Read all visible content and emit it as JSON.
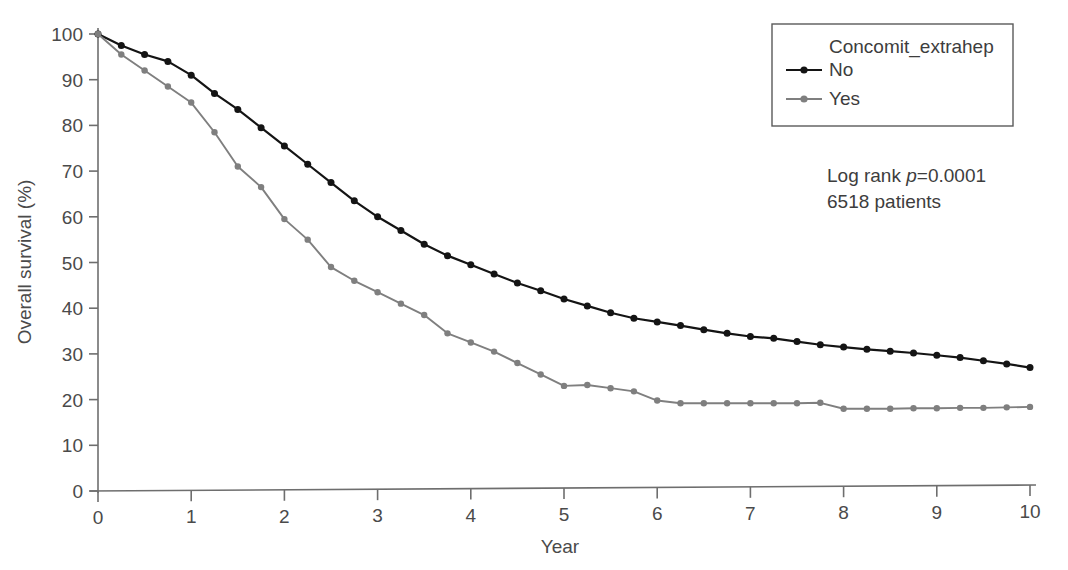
{
  "chart_data": {
    "type": "line",
    "title": "",
    "xlabel": "Year",
    "ylabel": "Overall survival (%)",
    "xlim": [
      0,
      10
    ],
    "ylim": [
      0,
      100
    ],
    "xticks": [
      0,
      1,
      2,
      3,
      4,
      5,
      6,
      7,
      8,
      9,
      10
    ],
    "yticks": [
      0,
      10,
      20,
      30,
      40,
      50,
      60,
      70,
      80,
      90,
      100
    ],
    "grid": false,
    "legend_position": "top-right",
    "legend_title": "Concomit_extrahep",
    "markers": true,
    "marker_interval": 0.25,
    "series": [
      {
        "name": "No",
        "color": "#141414",
        "x": [
          0,
          0.25,
          0.5,
          0.75,
          1,
          1.25,
          1.5,
          1.75,
          2,
          2.25,
          2.5,
          2.75,
          3,
          3.25,
          3.5,
          3.75,
          4,
          4.25,
          4.5,
          4.75,
          5,
          5.25,
          5.5,
          5.75,
          6,
          6.25,
          6.5,
          6.75,
          7,
          7.25,
          7.5,
          7.75,
          8,
          8.25,
          8.5,
          8.75,
          9,
          9.25,
          9.5,
          9.75,
          10
        ],
        "values": [
          100,
          97.5,
          95.5,
          94,
          91,
          87,
          83.5,
          79.5,
          75.5,
          71.5,
          67.5,
          63.5,
          60,
          57,
          54,
          51.5,
          49.5,
          47.5,
          45.5,
          43.8,
          42,
          40.5,
          39,
          37.8,
          37,
          36.2,
          35.3,
          34.5,
          33.8,
          33.4,
          32.7,
          32,
          31.5,
          31,
          30.6,
          30.2,
          29.7,
          29.2,
          28.5,
          27.8,
          27
        ]
      },
      {
        "name": "Yes",
        "color": "#7f7f7f",
        "x": [
          0,
          0.25,
          0.5,
          0.75,
          1,
          1.25,
          1.5,
          1.75,
          2,
          2.25,
          2.5,
          2.75,
          3,
          3.25,
          3.5,
          3.75,
          4,
          4.25,
          4.5,
          4.75,
          5,
          5.25,
          5.5,
          5.75,
          6,
          6.25,
          6.5,
          6.75,
          7,
          7.25,
          7.5,
          7.75,
          8,
          8.25,
          8.5,
          8.75,
          9,
          9.25,
          9.5,
          9.75,
          10
        ],
        "values": [
          100,
          95.5,
          92,
          88.5,
          85,
          78.5,
          71,
          66.5,
          59.5,
          55,
          49,
          46,
          43.5,
          41,
          38.5,
          34.5,
          32.5,
          30.5,
          28,
          25.5,
          23,
          23.2,
          22.5,
          21.8,
          19.8,
          19.2,
          19.2,
          19.2,
          19.2,
          19.2,
          19.2,
          19.3,
          18,
          18,
          18,
          18.1,
          18.1,
          18.2,
          18.2,
          18.3,
          18.4
        ]
      }
    ],
    "annotations": [
      "Log rank p=0.0001",
      "6518 patients"
    ]
  },
  "annotation": {
    "logrank_prefix": "Log rank ",
    "logrank_p": "p",
    "logrank_value": "=0.0001",
    "patients": "6518 patients"
  },
  "legend": {
    "title": "Concomit_extrahep",
    "items": [
      {
        "label": "No",
        "color": "#141414"
      },
      {
        "label": "Yes",
        "color": "#7f7f7f"
      }
    ]
  },
  "axes": {
    "x_title": "Year",
    "y_title": "Overall survival (%)"
  },
  "colors": {
    "series_no": "#141414",
    "series_yes": "#7f7f7f",
    "axis": "#6e6e6e",
    "text": "#3d3d3d",
    "background": "#ffffff"
  }
}
